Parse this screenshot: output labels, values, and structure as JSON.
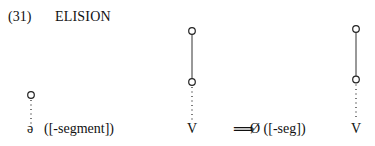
{
  "example": {
    "number": "(31)",
    "title": "ELISION"
  },
  "diagram": {
    "left_segment": "ə",
    "left_feature": "([-segment])",
    "middle_segment": "V",
    "arrow": "⟹",
    "result": "Ø ([-seg])",
    "right_segment": "V"
  }
}
